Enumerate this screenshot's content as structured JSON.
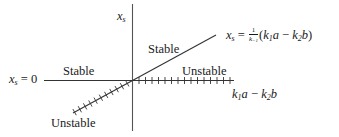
{
  "diagram": {
    "type": "stability-diagram",
    "axes": {
      "vertical_label": {
        "base": "x",
        "sub": "s"
      },
      "horizontal_label": {
        "k1": "k",
        "k1_sub": "1",
        "a": "a",
        "minus": " − ",
        "k2": "k",
        "k2_sub": "2",
        "b": "b"
      }
    },
    "branches": {
      "trivial": {
        "label_base": "x",
        "label_sub": "s",
        "label_eq": " = 0",
        "left_stability": "Stable",
        "right_stability": "Unstable"
      },
      "nontrivial": {
        "label_base": "x",
        "label_sub": "s",
        "label_eq": " = ",
        "frac_num": "1",
        "frac_den": "k",
        "frac_den_sub": "−1",
        "paren_open": "(",
        "k1": "k",
        "k1_sub": "1",
        "a": "a",
        "minus": " − ",
        "k2": "k",
        "k2_sub": "2",
        "b": "b",
        "paren_close": ")",
        "upper_stability": "Stable",
        "lower_stability": "Unstable"
      }
    },
    "colors": {
      "line": "#333333",
      "axis": "#555555",
      "text": "#1a1a1a"
    }
  }
}
